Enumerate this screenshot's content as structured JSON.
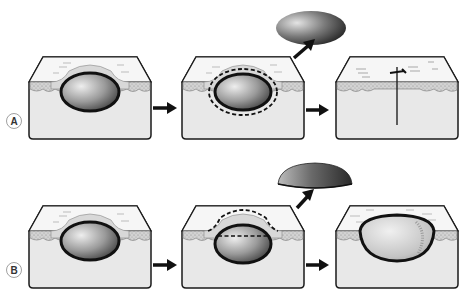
{
  "figure": {
    "rows": [
      {
        "label": "A",
        "panels": [
          {
            "id": "A1",
            "description": "cyst within skin tissue block"
          },
          {
            "id": "A2",
            "description": "cyst with dashed excision margin around capsule"
          },
          {
            "id": "A3",
            "description": "closed linear wound after excision"
          }
        ],
        "removed_specimen": "ellipsoid cyst"
      },
      {
        "label": "B",
        "panels": [
          {
            "id": "B1",
            "description": "cyst within skin tissue block"
          },
          {
            "id": "B2",
            "description": "cyst with dashed line marking deroofing cut"
          },
          {
            "id": "B3",
            "description": "open cavity after removal of roof (marsupialisation)"
          }
        ],
        "removed_specimen": "dome-shaped cyst roof"
      }
    ],
    "colors": {
      "outline": "#1a1a1a",
      "tissue_top": "#f4f4f4",
      "tissue_front": "#e6e6e6",
      "dermis_band": "#c8c8c8",
      "cyst_light": "#e8e8e8",
      "cyst_dark": "#4a4a4a"
    }
  }
}
